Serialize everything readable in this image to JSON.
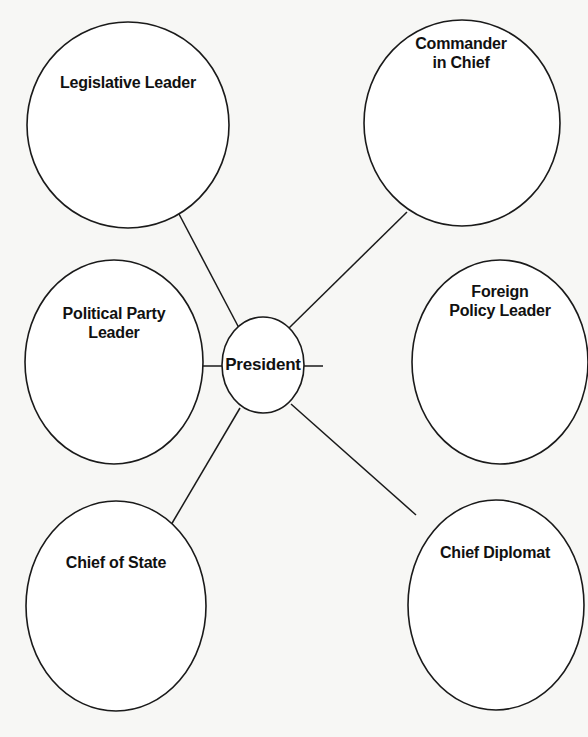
{
  "diagram": {
    "type": "concept-web",
    "center": {
      "label": "President"
    },
    "nodes": [
      {
        "id": "legislative-leader",
        "line1": "Legislative Leader",
        "line2": ""
      },
      {
        "id": "commander-in-chief",
        "line1": "Commander",
        "line2": "in Chief"
      },
      {
        "id": "political-party-leader",
        "line1": "Political Party",
        "line2": "Leader"
      },
      {
        "id": "foreign-policy-leader",
        "line1": "Foreign",
        "line2": "Policy Leader"
      },
      {
        "id": "chief-of-state",
        "line1": "Chief of State",
        "line2": ""
      },
      {
        "id": "chief-diplomat",
        "line1": "Chief Diplomat",
        "line2": ""
      }
    ],
    "colors": {
      "paper": "#f7f7f5",
      "stroke": "#1a1a1a",
      "fill": "#ffffff",
      "text": "#111111"
    }
  }
}
